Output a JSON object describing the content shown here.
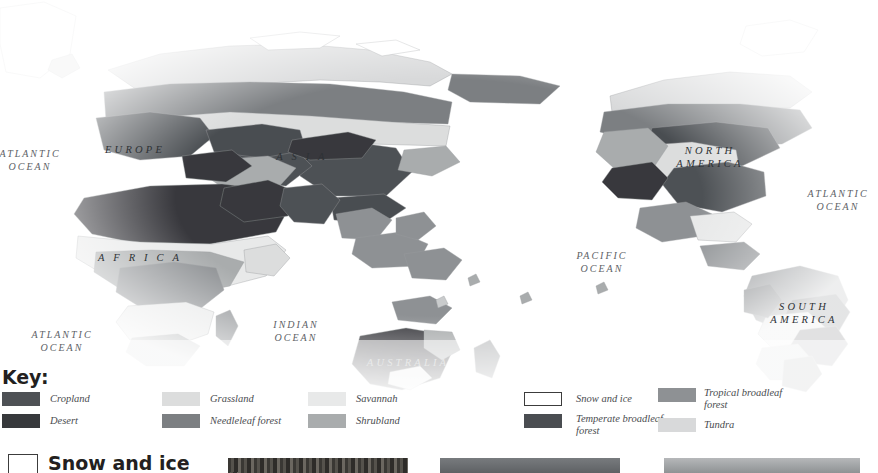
{
  "figure": {
    "name": "world-land-cover-map",
    "type": "thematic-world-map",
    "projection": "pacific-centred world map, greyscale land-cover classes"
  },
  "map": {
    "ocean_labels": [
      {
        "name": "atlantic-ocean-northeast",
        "text": "ATLANTIC\nOCEAN",
        "x": -8,
        "y": 148,
        "w": 76,
        "clipped_left": true
      },
      {
        "name": "atlantic-ocean-south",
        "text": "ATLANTIC\nOCEAN",
        "x": 24,
        "y": 329,
        "w": 76
      },
      {
        "name": "indian-ocean",
        "text": "INDIAN\nOCEAN",
        "x": 260,
        "y": 319,
        "w": 72
      },
      {
        "name": "pacific-ocean",
        "text": "PACIFIC\nOCEAN",
        "x": 564,
        "y": 250,
        "w": 76
      },
      {
        "name": "atlantic-ocean-northwest",
        "text": "ATLANTIC\nOCEAN",
        "x": 800,
        "y": 188,
        "w": 76
      }
    ],
    "continent_labels": [
      {
        "name": "label-europe",
        "text": "EUROPE",
        "x": 100,
        "y": 143,
        "w": 70
      },
      {
        "name": "label-asia",
        "text": "A S I A",
        "x": 262,
        "y": 150,
        "w": 80
      },
      {
        "name": "label-africa",
        "text": "A F R I C A",
        "x": 92,
        "y": 251,
        "w": 96
      },
      {
        "name": "label-australia",
        "text": "AUSTRALIA",
        "x": 366,
        "y": 356,
        "w": 84
      },
      {
        "name": "label-north-america",
        "text": "NORTH\nAMERICA",
        "x": 670,
        "y": 144,
        "w": 80
      },
      {
        "name": "label-south-america",
        "text": "SOUTH\nAMERICA",
        "x": 766,
        "y": 300,
        "w": 76
      }
    ]
  },
  "legend": {
    "title": "Key:",
    "columns": [
      {
        "name": "legend-column-1",
        "x": 2,
        "label_x": 48,
        "label_w": 96,
        "items": [
          {
            "name": "legend-item-cropland",
            "label": "Cropland",
            "color": "#4e5155",
            "outlined": false
          },
          {
            "name": "legend-item-desert",
            "label": "Desert",
            "color": "#37393c",
            "outlined": false
          }
        ]
      },
      {
        "name": "legend-column-2",
        "x": 162,
        "label_x": 48,
        "label_w": 110,
        "items": [
          {
            "name": "legend-item-grassland",
            "label": "Grassland",
            "color": "#dcdddd",
            "outlined": false
          },
          {
            "name": "legend-item-needleleaf-forest",
            "label": "Needleleaf forest",
            "color": "#7c7f82",
            "outlined": false
          }
        ]
      },
      {
        "name": "legend-column-3",
        "x": 308,
        "label_x": 48,
        "label_w": 100,
        "items": [
          {
            "name": "legend-item-savannah",
            "label": "Savannah",
            "color": "#e8e9e9",
            "outlined": false
          },
          {
            "name": "legend-item-shrubland",
            "label": "Shrubland",
            "color": "#a9acad",
            "outlined": false
          }
        ]
      },
      {
        "name": "legend-column-4",
        "x": 524,
        "label_x": 52,
        "label_w": 118,
        "items": [
          {
            "name": "legend-item-snow-and-ice",
            "label": "Snow and ice",
            "color": "#ffffff",
            "outlined": true
          },
          {
            "name": "legend-item-temperate-broadleaf-forest",
            "label": "Temperate broadleaf\nforest",
            "color": "#4a4d51",
            "outlined": false
          }
        ]
      },
      {
        "name": "legend-column-5",
        "x": 658,
        "label_x": 46,
        "label_w": 112,
        "items": [
          {
            "name": "legend-item-tropical-broadleaf-forest",
            "label": "Tropical broadleaf\nforest",
            "color": "#8e9194",
            "outlined": false
          },
          {
            "name": "legend-item-tundra",
            "label": "Tundra",
            "color": "#d8d9da",
            "outlined": false
          }
        ]
      }
    ]
  },
  "bottom_section": {
    "name": "snow-and-ice-section",
    "heading": "Snow and ice",
    "swatch_color": "#ffffff",
    "clipped": true,
    "photos": [
      {
        "name": "photo-thumbnail-1",
        "x": 228,
        "w": 180,
        "tone": "#4a4743"
      },
      {
        "name": "photo-thumbnail-2",
        "x": 440,
        "w": 180,
        "tone": "#6e7174"
      },
      {
        "name": "photo-thumbnail-3",
        "x": 664,
        "w": 196,
        "tone": "#9ea1a3"
      }
    ]
  },
  "palette": {
    "cropland": "#4e5155",
    "desert": "#37393c",
    "grassland": "#dcdddd",
    "needleleaf_forest": "#7c7f82",
    "savannah": "#e8e9e9",
    "shrubland": "#a9acad",
    "snow_and_ice": "#ffffff",
    "temperate_broadleaf_forest": "#4a4d51",
    "tropical_broadleaf_forest": "#8e9194",
    "tundra": "#d8d9da",
    "ocean": "#ffffff",
    "coastline": "#9a9c9e"
  }
}
